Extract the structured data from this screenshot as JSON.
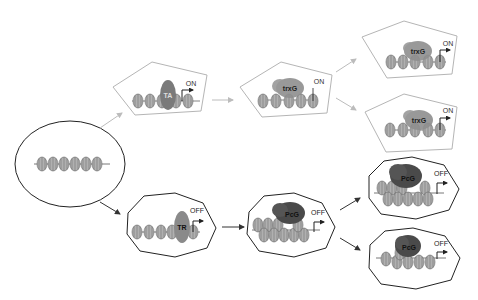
{
  "diagram": {
    "type": "epigenetic-memory-flow",
    "colors": {
      "active_outline": "#b5b5b5",
      "repressed_outline": "#333333",
      "active_arrow": "#bcbcbc",
      "repressed_arrow": "#333333",
      "nucleosome": "#a8a8a8",
      "ta": "#7a7a7a",
      "tr": "#8a8a8a",
      "trxg": "#8e8e8e",
      "pcg": "#4a4a4a"
    },
    "start": {
      "shape": "ellipse",
      "nucleosomes": 6
    },
    "active_path": {
      "step1": {
        "factor": "TA",
        "state": "ON"
      },
      "step2": {
        "factor": "trxG",
        "state": "ON"
      },
      "step3a": {
        "factor": "trxG",
        "state": "ON"
      },
      "step3b": {
        "factor": "trxG",
        "state": "ON"
      }
    },
    "repressed_path": {
      "step1": {
        "factor": "TR",
        "state": "OFF"
      },
      "step2": {
        "factor": "PcG",
        "state": "OFF"
      },
      "step3a": {
        "factor": "PcG",
        "state": "OFF"
      },
      "step3b": {
        "factor": "PcG",
        "state": "OFF"
      }
    }
  }
}
